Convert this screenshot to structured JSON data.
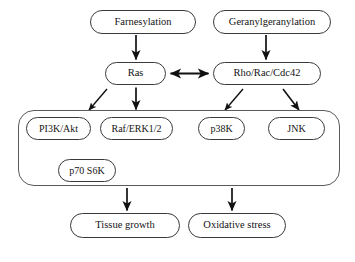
{
  "diagram": {
    "type": "flowchart",
    "style": {
      "node_fill": "#ffffff",
      "node_stroke": "#3a3a3a",
      "group_stroke": "#5a5a5a",
      "arrow_color": "#111111",
      "text_color": "#141414",
      "background": "#ffffff"
    },
    "nodes": {
      "farnesylation": {
        "label": "Farnesylation"
      },
      "geranylgeranylation": {
        "label": "Geranylgeranylation"
      },
      "ras": {
        "label": "Ras"
      },
      "rho_rac_cdc42": {
        "label": "Rho/Rac/Cdc42"
      },
      "pi3k_akt": {
        "label": "PI3K/Akt"
      },
      "raf_erk": {
        "label": "Raf/ERK1/2"
      },
      "p38k": {
        "label": "p38K"
      },
      "jnk": {
        "label": "JNK"
      },
      "p70_s6k": {
        "label": "p70 S6K"
      },
      "tissue_growth": {
        "label": "Tissue growth"
      },
      "oxidative_stress": {
        "label": "Oxidative stress"
      }
    },
    "group": {
      "label": "",
      "contains": [
        "pi3k_akt",
        "raf_erk",
        "p38k",
        "jnk",
        "p70_s6k"
      ]
    },
    "edges": [
      {
        "from": "farnesylation",
        "to": "ras",
        "kind": "arrow",
        "direction": "down"
      },
      {
        "from": "geranylgeranylation",
        "to": "rho_rac_cdc42",
        "kind": "arrow",
        "direction": "down"
      },
      {
        "from": "ras",
        "to": "rho_rac_cdc42",
        "kind": "double-arrow",
        "direction": "horizontal"
      },
      {
        "from": "ras",
        "to": "pi3k_akt",
        "kind": "arrow",
        "direction": "down-left"
      },
      {
        "from": "ras",
        "to": "raf_erk",
        "kind": "arrow",
        "direction": "down"
      },
      {
        "from": "rho_rac_cdc42",
        "to": "p38k",
        "kind": "arrow",
        "direction": "down-left"
      },
      {
        "from": "rho_rac_cdc42",
        "to": "jnk",
        "kind": "arrow",
        "direction": "down-right"
      },
      {
        "from": "pi3k_akt",
        "to": "p70_s6k",
        "kind": "arrow",
        "direction": "down-right"
      },
      {
        "from": "raf_erk",
        "to": "p70_s6k",
        "kind": "arrow",
        "direction": "down-left"
      },
      {
        "from": "group",
        "to": "tissue_growth",
        "kind": "arrow",
        "direction": "down"
      },
      {
        "from": "group",
        "to": "oxidative_stress",
        "kind": "arrow",
        "direction": "down"
      }
    ]
  }
}
